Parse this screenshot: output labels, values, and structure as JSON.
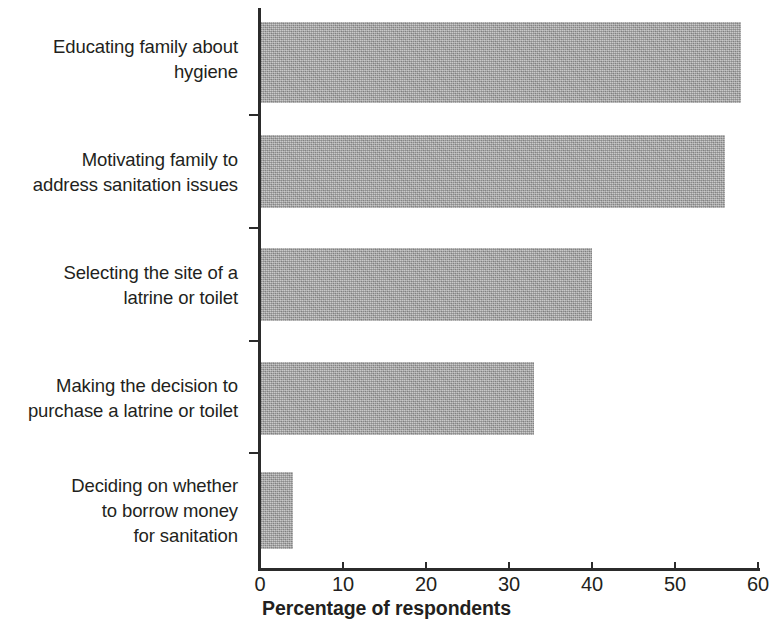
{
  "chart_data": {
    "type": "bar",
    "orientation": "horizontal",
    "title": "",
    "xlabel": "Percentage of respondents",
    "ylabel": "",
    "xlim": [
      0,
      60
    ],
    "xticks": [
      0,
      10,
      20,
      30,
      40,
      50,
      60
    ],
    "grid": false,
    "legend": null,
    "bar_color": "#ababab",
    "axis_color": "#2b2b2b",
    "categories": [
      "Educating family about hygiene",
      "Motivating family to address sanitation issues",
      "Selecting the site of a latrine or toilet",
      "Making the decision to purchase a latrine or toilet",
      "Deciding on whether to borrow money for sanitation"
    ],
    "values": [
      58,
      56,
      40,
      33,
      4
    ]
  },
  "axis": {
    "x_title": "Percentage of respondents",
    "tick_labels": [
      "0",
      "10",
      "20",
      "30",
      "40",
      "50",
      "60"
    ]
  },
  "categories": [
    {
      "lines": [
        "Educating family about",
        "hygiene"
      ],
      "value": 58
    },
    {
      "lines": [
        "Motivating family to",
        "address sanitation issues"
      ],
      "value": 56
    },
    {
      "lines": [
        "Selecting the site of a",
        "latrine or toilet"
      ],
      "value": 40
    },
    {
      "lines": [
        "Making the decision to",
        "purchase a latrine or toilet"
      ],
      "value": 33
    },
    {
      "lines": [
        "Deciding on whether",
        "to borrow money",
        "for sanitation"
      ],
      "value": 4
    }
  ],
  "label_text": {
    "cat0_line0": "Educating family about",
    "cat0_line1": "hygiene",
    "cat1_line0": "Motivating family to",
    "cat1_line1": "address sanitation issues",
    "cat2_line0": "Selecting the site of a",
    "cat2_line1": "latrine or toilet",
    "cat3_line0": "Making the decision to",
    "cat3_line1": "purchase a latrine or toilet",
    "cat4_line0": "Deciding on whether",
    "cat4_line1": "to borrow money",
    "cat4_line2": "for sanitation"
  }
}
